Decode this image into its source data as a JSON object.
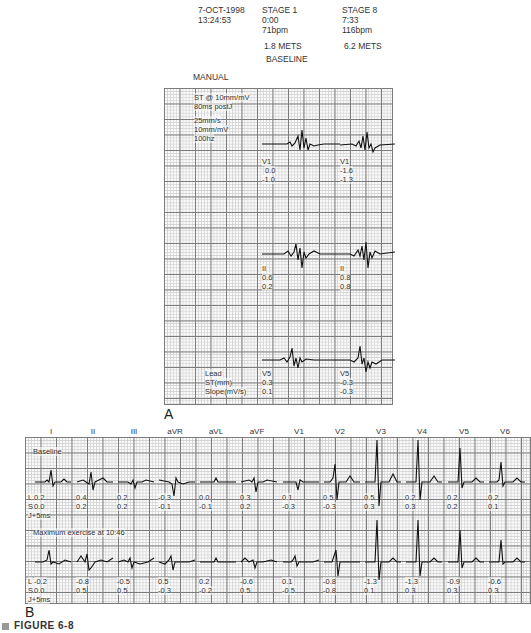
{
  "header": {
    "date": "7-OCT-1998",
    "time": "13:24:53",
    "stage_left": {
      "stage": "STAGE 1",
      "elapsed": "0:00",
      "hr": "71bpm",
      "mets": "1.8 METS",
      "label": "BASELINE"
    },
    "stage_right": {
      "stage": "STAGE 8",
      "elapsed": "7:33",
      "hr": "116bpm",
      "mets": "6.2 METS"
    },
    "mode": "MANUAL"
  },
  "panel_a": {
    "letter": "A",
    "settings": [
      "ST @ 10mm/mV",
      "80ms postJ",
      "",
      "25mm/s",
      "10mm/mV",
      "100hz"
    ],
    "row_labels": [
      "Lead",
      "ST(mm)",
      "Slope(mV/s)"
    ],
    "leads": [
      {
        "baseline": {
          "lead": "V1",
          "st": "0.0",
          "slope": "-1.0"
        },
        "exercise": {
          "lead": "V1",
          "st": "-1.6",
          "slope": "-1.3"
        }
      },
      {
        "baseline": {
          "lead": "II",
          "st": "0.6",
          "slope": "0.2"
        },
        "exercise": {
          "lead": "II",
          "st": "0.8",
          "slope": "0.8"
        }
      },
      {
        "baseline": {
          "lead": "V5",
          "st": "0.3",
          "slope": "0.1"
        },
        "exercise": {
          "lead": "V5",
          "st": "-0.3",
          "slope": "-0.3"
        }
      }
    ]
  },
  "panel_b": {
    "letter": "B",
    "leads": [
      "I",
      "II",
      "III",
      "aVR",
      "aVL",
      "aVF",
      "V1",
      "V2",
      "V3",
      "V4",
      "V5",
      "V6"
    ],
    "row_key": {
      "l": "L",
      "s": "S",
      "j": "J+5ms"
    },
    "baseline": {
      "title": "Baseline",
      "L": [
        "0.2",
        "0.4",
        "0.2",
        "-0.3",
        "0.0",
        "0.3",
        "0.1",
        "0.5",
        "0.5",
        "0.2",
        "0.2",
        "0.2"
      ],
      "S": [
        "0.0",
        "0.2",
        "0.2",
        "-0.1",
        "-0.1",
        "0.2",
        "-0.3",
        "-0.3",
        "0.3",
        "0.3",
        "0.2",
        "0.1"
      ]
    },
    "exercise": {
      "title": "Maximum exercise at 10:46",
      "L": [
        "-0.2",
        "-0.8",
        "-0.5",
        "0.5",
        "0.2",
        "-0.6",
        "0.1",
        "-0.8",
        "-1.3",
        "-1.3",
        "-0.9",
        "-0.6"
      ],
      "S": [
        "0.0",
        "0.5",
        "0.5",
        "-0.3",
        "-0.2",
        "0.5",
        "-0.5",
        "-0.8",
        "0.1",
        "0.3",
        "0.3",
        "0.3"
      ]
    }
  },
  "caption": {
    "label": "FIGURE 6-8"
  }
}
